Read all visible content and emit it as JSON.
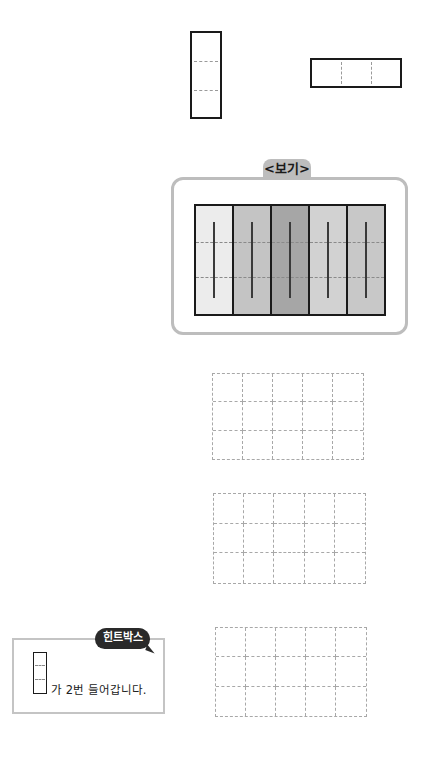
{
  "examples": {
    "vertical_piece": {
      "cells": 3,
      "orientation": "vertical"
    },
    "horizontal_piece": {
      "cells": 3,
      "orientation": "horizontal"
    }
  },
  "example_box": {
    "title": "<보기>",
    "strips": [
      {
        "color": "#ececec"
      },
      {
        "color": "#c4c4c4"
      },
      {
        "color": "#a6a6a6"
      },
      {
        "color": "#d2d2d2"
      },
      {
        "color": "#c8c8c8"
      }
    ]
  },
  "practice_grids": [
    {
      "rows": 3,
      "cols": 5
    },
    {
      "rows": 3,
      "cols": 5
    },
    {
      "rows": 3,
      "cols": 5
    }
  ],
  "hint_box": {
    "badge": "힌트박스",
    "text": "가 2번 들어갑니다."
  }
}
